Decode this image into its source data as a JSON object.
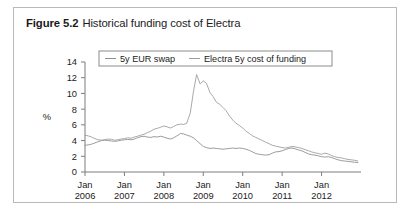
{
  "figure": {
    "number": "Figure 5.2",
    "caption": "Historical funding cost of Electra"
  },
  "chart_data": {
    "type": "line",
    "title": "Historical funding cost of Electra",
    "xlabel": "",
    "ylabel": "%",
    "ylim": [
      0,
      14
    ],
    "yticks": [
      0,
      2,
      4,
      6,
      8,
      10,
      12,
      14
    ],
    "ytick_labels": [
      "0",
      "2",
      "4",
      "6",
      "8",
      "10",
      "12",
      "14"
    ],
    "xtick_labels": [
      "Jan\n2006",
      "Jan\n2007",
      "Jan\n2008",
      "Jan\n2009",
      "Jan\n2010",
      "Jan\n2011",
      "Jan\n2012"
    ],
    "xticks": [
      {
        "line1": "Jan",
        "line2": "2006"
      },
      {
        "line1": "Jan",
        "line2": "2007"
      },
      {
        "line1": "Jan",
        "line2": "2008"
      },
      {
        "line1": "Jan",
        "line2": "2009"
      },
      {
        "line1": "Jan",
        "line2": "2010"
      },
      {
        "line1": "Jan",
        "line2": "2011"
      },
      {
        "line1": "Jan",
        "line2": "2012"
      }
    ],
    "xlim": [
      2006.0,
      2013.0
    ],
    "grid": false,
    "legend_position": "top-center",
    "legend": [
      {
        "name": "5y EUR swap",
        "color": "#8e8e8e"
      },
      {
        "name": "Electra 5y cost of funding",
        "color": "#9d9d9d"
      }
    ],
    "series": [
      {
        "name": "5y EUR swap",
        "color": "#8a8a8a",
        "x": [
          2006.0,
          2006.08,
          2006.17,
          2006.25,
          2006.33,
          2006.42,
          2006.5,
          2006.58,
          2006.67,
          2006.75,
          2006.83,
          2006.92,
          2007.0,
          2007.08,
          2007.17,
          2007.25,
          2007.33,
          2007.42,
          2007.5,
          2007.58,
          2007.67,
          2007.75,
          2007.83,
          2007.92,
          2008.0,
          2008.08,
          2008.17,
          2008.25,
          2008.33,
          2008.42,
          2008.5,
          2008.58,
          2008.67,
          2008.75,
          2008.83,
          2008.92,
          2009.0,
          2009.08,
          2009.17,
          2009.25,
          2009.33,
          2009.42,
          2009.5,
          2009.58,
          2009.67,
          2009.75,
          2009.83,
          2009.92,
          2010.0,
          2010.08,
          2010.17,
          2010.25,
          2010.33,
          2010.42,
          2010.5,
          2010.58,
          2010.67,
          2010.75,
          2010.83,
          2010.92,
          2011.0,
          2011.08,
          2011.17,
          2011.25,
          2011.33,
          2011.42,
          2011.5,
          2011.58,
          2011.67,
          2011.75,
          2011.83,
          2011.92,
          2012.0,
          2012.08,
          2012.17,
          2012.25,
          2012.33,
          2012.42,
          2012.5,
          2012.58,
          2012.67,
          2012.75,
          2012.83,
          2012.92
        ],
        "values": [
          3.4,
          3.45,
          3.55,
          3.7,
          3.85,
          4.0,
          4.05,
          4.0,
          3.95,
          3.9,
          3.95,
          4.05,
          4.1,
          4.15,
          4.1,
          4.2,
          4.35,
          4.5,
          4.55,
          4.45,
          4.4,
          4.5,
          4.45,
          4.55,
          4.45,
          4.3,
          4.2,
          4.35,
          4.6,
          4.9,
          4.85,
          4.7,
          4.55,
          4.35,
          4.0,
          3.6,
          3.25,
          3.1,
          3.0,
          3.05,
          3.0,
          2.95,
          2.9,
          2.95,
          3.0,
          3.05,
          3.0,
          3.05,
          3.0,
          2.9,
          2.75,
          2.55,
          2.35,
          2.25,
          2.2,
          2.15,
          2.2,
          2.4,
          2.55,
          2.6,
          2.7,
          2.85,
          3.0,
          3.05,
          2.95,
          2.8,
          2.7,
          2.5,
          2.3,
          2.2,
          2.15,
          2.05,
          1.95,
          1.9,
          1.95,
          1.85,
          1.7,
          1.55,
          1.45,
          1.4,
          1.35,
          1.3,
          1.25,
          1.2
        ]
      },
      {
        "name": "Electra 5y cost of funding",
        "color": "#9a9a9a",
        "x": [
          2006.0,
          2006.08,
          2006.17,
          2006.25,
          2006.33,
          2006.42,
          2006.5,
          2006.58,
          2006.67,
          2006.75,
          2006.83,
          2006.92,
          2007.0,
          2007.08,
          2007.17,
          2007.25,
          2007.33,
          2007.42,
          2007.5,
          2007.58,
          2007.67,
          2007.75,
          2007.83,
          2007.92,
          2008.0,
          2008.08,
          2008.17,
          2008.25,
          2008.33,
          2008.42,
          2008.5,
          2008.58,
          2008.67,
          2008.75,
          2008.83,
          2008.92,
          2009.0,
          2009.08,
          2009.17,
          2009.25,
          2009.33,
          2009.42,
          2009.5,
          2009.58,
          2009.67,
          2009.75,
          2009.83,
          2009.92,
          2010.0,
          2010.08,
          2010.17,
          2010.25,
          2010.33,
          2010.42,
          2010.5,
          2010.58,
          2010.67,
          2010.75,
          2010.83,
          2010.92,
          2011.0,
          2011.08,
          2011.17,
          2011.25,
          2011.33,
          2011.42,
          2011.5,
          2011.58,
          2011.67,
          2011.75,
          2011.83,
          2011.92,
          2012.0,
          2012.08,
          2012.17,
          2012.25,
          2012.33,
          2012.42,
          2012.5,
          2012.58,
          2012.67,
          2012.75,
          2012.83,
          2012.92
        ],
        "values": [
          4.7,
          4.6,
          4.45,
          4.25,
          4.1,
          4.05,
          4.1,
          4.2,
          4.15,
          4.05,
          4.1,
          4.2,
          4.25,
          4.35,
          4.3,
          4.45,
          4.55,
          4.7,
          4.8,
          5.0,
          5.2,
          5.45,
          5.55,
          5.7,
          5.85,
          5.75,
          5.6,
          5.8,
          6.0,
          6.1,
          6.05,
          6.2,
          7.5,
          10.2,
          12.4,
          11.2,
          11.6,
          11.3,
          10.1,
          9.6,
          8.9,
          8.6,
          8.2,
          7.8,
          7.1,
          6.6,
          6.2,
          5.9,
          5.6,
          5.2,
          4.9,
          4.6,
          4.4,
          4.2,
          4.0,
          3.8,
          3.6,
          3.4,
          3.3,
          3.2,
          3.1,
          3.05,
          3.15,
          3.25,
          3.2,
          3.1,
          3.0,
          2.85,
          2.7,
          2.55,
          2.45,
          2.35,
          2.25,
          2.4,
          2.3,
          2.1,
          1.95,
          1.85,
          1.8,
          1.7,
          1.6,
          1.55,
          1.5,
          1.4
        ]
      }
    ]
  }
}
